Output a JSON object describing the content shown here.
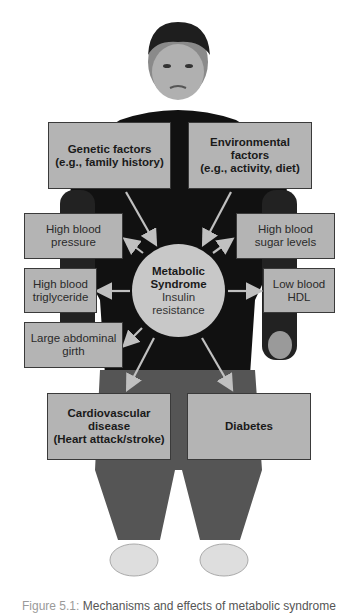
{
  "figure": {
    "top_inputs": [
      {
        "id": "genetic",
        "lines": [
          "Genetic factors",
          "(e.g., family history)"
        ]
      },
      {
        "id": "environmental",
        "lines": [
          "Environmental",
          "factors",
          "(e.g., activity, diet)"
        ]
      }
    ],
    "center": {
      "title_lines": [
        "Metabolic",
        "Syndrome"
      ],
      "subtitle_lines": [
        "Insulin",
        "resistance"
      ]
    },
    "side_effects": [
      {
        "id": "high-blood-pressure",
        "lines": [
          "High blood",
          "pressure"
        ]
      },
      {
        "id": "high-blood-sugar",
        "lines": [
          "High blood",
          "sugar levels"
        ]
      },
      {
        "id": "high-triglyceride",
        "lines": [
          "High blood",
          "triglyceride"
        ]
      },
      {
        "id": "low-hdl",
        "lines": [
          "Low blood",
          "HDL"
        ]
      },
      {
        "id": "abdominal-girth",
        "lines": [
          "Large abdominal",
          "girth"
        ]
      }
    ],
    "outcomes": [
      {
        "id": "cardiovascular",
        "lines": [
          "Cardiovascular",
          "disease",
          "(Heart attack/stroke)"
        ]
      },
      {
        "id": "diabetes",
        "lines": [
          "Diabetes"
        ]
      }
    ],
    "colors": {
      "box_fill": "#b4b4b4",
      "box_border": "#3a3a3a",
      "circle_fill": "#c8c8c8",
      "arrow": "#c0c0c0",
      "figure_body": "#111111"
    }
  },
  "caption": {
    "label": "Figure 5.1:",
    "text": "Mechanisms and effects of metabolic syndrome"
  }
}
